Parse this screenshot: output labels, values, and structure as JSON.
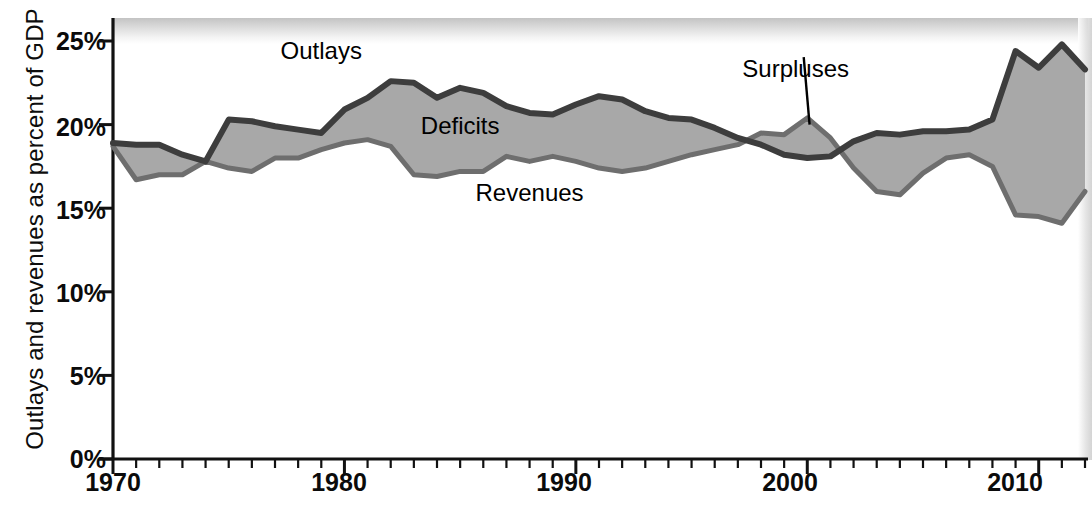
{
  "chart_data": {
    "type": "area",
    "title": "",
    "subtitle": "",
    "xlabel": "",
    "ylabel": "Outlays and revenues as percent of GDP",
    "xlim": [
      1970,
      2012
    ],
    "ylim": [
      0,
      27
    ],
    "grid": false,
    "legend_position": "inline-annotations",
    "ytick_values": [
      0,
      5,
      10,
      15,
      20,
      25
    ],
    "ytick_labels": [
      "0%",
      "5%",
      "10%",
      "15%",
      "20%",
      "25%"
    ],
    "xtick_labels": [
      "1970",
      "1980",
      "1990",
      "2000",
      "2010"
    ],
    "xtick_values": [
      1970,
      1980,
      1990,
      2000,
      2010
    ],
    "minor_xticks": "every year from 1970 to 2012",
    "x": [
      1970,
      1971,
      1972,
      1973,
      1974,
      1975,
      1976,
      1977,
      1978,
      1979,
      1980,
      1981,
      1982,
      1983,
      1984,
      1985,
      1986,
      1987,
      1988,
      1989,
      1990,
      1991,
      1992,
      1993,
      1994,
      1995,
      1996,
      1997,
      1998,
      1999,
      2000,
      2001,
      2002,
      2003,
      2004,
      2005,
      2006,
      2007,
      2008,
      2009,
      2010,
      2011,
      2012
    ],
    "series": [
      {
        "name": "Outlays",
        "color": "#3d3d3d",
        "values": [
          18.9,
          18.8,
          18.8,
          18.2,
          17.8,
          20.3,
          20.2,
          19.9,
          19.7,
          19.5,
          20.9,
          21.6,
          22.6,
          22.5,
          21.6,
          22.2,
          21.9,
          21.1,
          20.7,
          20.6,
          21.2,
          21.7,
          21.5,
          20.8,
          20.4,
          20.3,
          19.8,
          19.2,
          18.8,
          18.2,
          18.0,
          18.1,
          19.0,
          19.5,
          19.4,
          19.6,
          19.6,
          19.7,
          20.3,
          24.4,
          23.4,
          24.8,
          23.3
        ]
      },
      {
        "name": "Revenues",
        "color": "#6e6e6e",
        "values": [
          18.7,
          16.7,
          17.0,
          17.0,
          17.8,
          17.4,
          17.2,
          18.0,
          18.0,
          18.5,
          18.9,
          19.1,
          18.7,
          17.0,
          16.9,
          17.2,
          17.2,
          18.1,
          17.8,
          18.1,
          17.8,
          17.4,
          17.2,
          17.4,
          17.8,
          18.2,
          18.5,
          18.8,
          19.5,
          19.4,
          20.4,
          19.2,
          17.4,
          16.0,
          15.8,
          17.1,
          18.0,
          18.2,
          17.5,
          14.6,
          14.5,
          14.1,
          16.0
        ]
      }
    ],
    "annotations": [
      {
        "label": "Outlays",
        "x": 1979,
        "y": 24.3
      },
      {
        "label": "Deficits",
        "x": 1985,
        "y": 19.8
      },
      {
        "label": "Revenues",
        "x": 1988,
        "y": 15.8
      },
      {
        "label": "Surpluses",
        "x": 1999.5,
        "y": 23.2,
        "has_leader_line": true
      }
    ],
    "fill_deficit_color": "#a8a8a8",
    "fill_surplus_color": "#a8a8a8"
  }
}
